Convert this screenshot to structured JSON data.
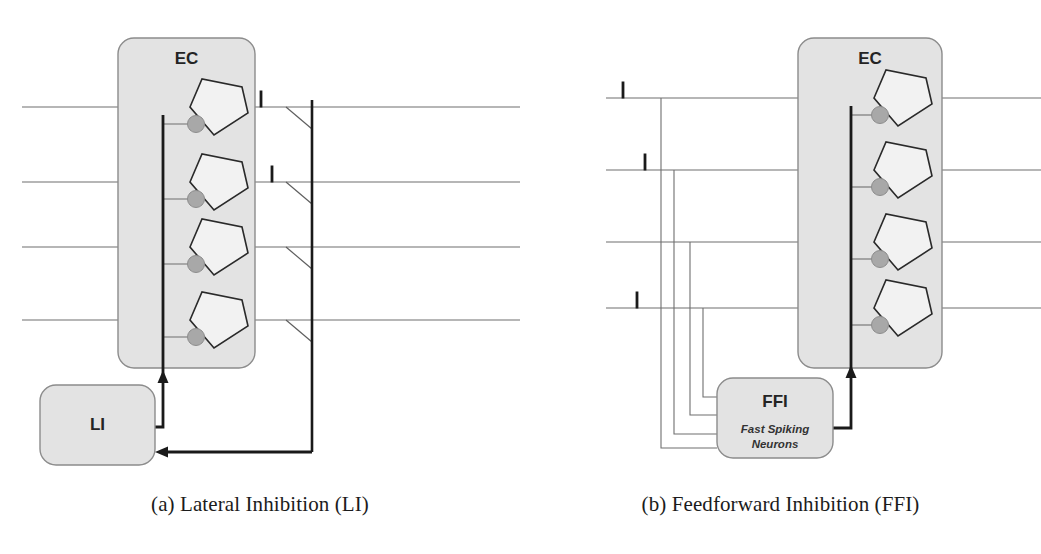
{
  "figure": {
    "background_color": "#ffffff",
    "panels": [
      {
        "id": "a",
        "caption": "(a) Lateral Inhibition (LI)",
        "region_box": {
          "label": "EC",
          "fill_color": "#e3e3e3",
          "stroke_color": "#8c8c8c",
          "x": 118,
          "y": 38,
          "w": 137,
          "h": 330,
          "r": 16
        },
        "inhibitory_box": {
          "label": "LI",
          "sublabel": "",
          "fill_color": "#e3e3e3",
          "stroke_color": "#8c8c8c",
          "x": 40,
          "y": 385,
          "w": 115,
          "h": 80,
          "r": 16
        },
        "neuron_count": 4,
        "neuron_rows_y": [
          107,
          182,
          247,
          320
        ],
        "neuron_label": "pyramidal-neuron",
        "synapse_color": "#a8a8a8",
        "synapse_stroke": "#8c8c8c",
        "axon_line_color": "#6f6f6f",
        "thick_line_color": "#1a1a1a",
        "spike_markers": [
          {
            "x": 261,
            "y": 99,
            "h": 17
          },
          {
            "x": 272,
            "y": 174,
            "h": 17
          }
        ],
        "spike_label": "I",
        "collector_x": 312,
        "inhib_trunk_x": 163,
        "feedback_y": 452,
        "arrow_up_x": 163,
        "arrow_up_tip_y": 370
      },
      {
        "id": "b",
        "caption": "(b) Feedforward Inhibition (FFI)",
        "region_box": {
          "label": "EC",
          "fill_color": "#e3e3e3",
          "stroke_color": "#8c8c8c",
          "x": 278,
          "y": 38,
          "w": 144,
          "h": 330,
          "r": 16
        },
        "inhibitory_box": {
          "label": "FFI",
          "sublabel_line1": "Fast Spiking",
          "sublabel_line2": "Neurons",
          "fill_color": "#e3e3e3",
          "stroke_color": "#8c8c8c",
          "x": 197,
          "y": 378,
          "w": 116,
          "h": 80,
          "r": 16
        },
        "neuron_count": 4,
        "neuron_rows_y": [
          98,
          170,
          242,
          308
        ],
        "neuron_label": "pyramidal-neuron",
        "synapse_color": "#a8a8a8",
        "synapse_stroke": "#8c8c8c",
        "axon_line_color": "#6f6f6f",
        "thick_line_color": "#1a1a1a",
        "spike_markers": [
          {
            "x": 103,
            "y": 90,
            "h": 17
          },
          {
            "x": 125,
            "y": 162,
            "h": 17
          },
          {
            "x": 117,
            "y": 300,
            "h": 17
          }
        ],
        "spike_label": "I",
        "branch_xs": [
          141,
          154,
          170,
          183
        ],
        "branch_entry_ys": [
          448,
          434,
          415,
          397
        ],
        "inhib_trunk_x": 331,
        "arrow_up_tip_y": 365
      }
    ]
  }
}
